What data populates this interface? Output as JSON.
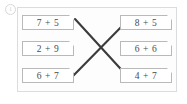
{
  "marker": {
    "label": "1",
    "name": "question-number-marker"
  },
  "card": {
    "background": "#fdfdfd",
    "border_color": "#dcdcdc"
  },
  "exercise": {
    "type": "matching-addition-expressions",
    "box_border_color": "#b9b9b9",
    "text_color": "#4a4a4a",
    "line_color": "#3c3c3c",
    "left_column": [
      {
        "label": "7 + 5"
      },
      {
        "label": "2 + 9"
      },
      {
        "label": "6 + 7"
      }
    ],
    "right_column": [
      {
        "label": "8 + 5"
      },
      {
        "label": "6 + 6"
      },
      {
        "label": "4 + 7"
      }
    ],
    "connector_lines": [
      {
        "name": "line-down-right",
        "x1": 57,
        "y1": 11,
        "x2": 111,
        "y2": 70
      },
      {
        "name": "line-up-right",
        "x1": 54,
        "y1": 69,
        "x2": 110,
        "y2": 12
      }
    ]
  }
}
